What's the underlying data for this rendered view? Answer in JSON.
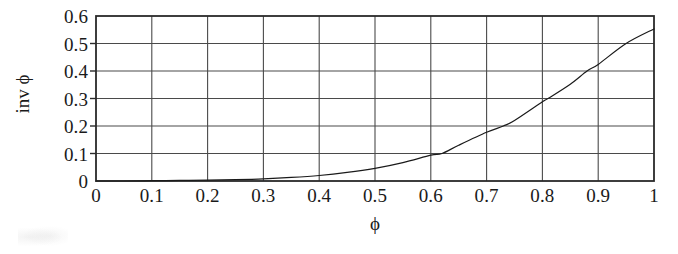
{
  "figure": {
    "background": "#ffffff",
    "ink_color": "#1a1a1a",
    "grid_color": "#4a4a4a",
    "frame_color": "#2a2a2a",
    "curve_color": "#1a1a1a"
  },
  "chart_data": {
    "type": "line",
    "title": "",
    "subtitle": "",
    "xlabel": "ϕ",
    "ylabel": "inv ϕ",
    "xlim": [
      0,
      1
    ],
    "ylim": [
      0,
      0.6
    ],
    "grid": true,
    "legend": null,
    "legend_position": "none",
    "xticks": [
      0,
      0.1,
      0.2,
      0.3,
      0.4,
      0.5,
      0.6,
      0.7,
      0.8,
      0.9,
      1
    ],
    "xticklabels": [
      "0",
      "0.1",
      "0.2",
      "0.3",
      "0.4",
      "0.5",
      "0.6",
      "0.7",
      "0.8",
      "0.9",
      "1"
    ],
    "yticks": [
      0,
      0.1,
      0.2,
      0.3,
      0.4,
      0.5,
      0.6
    ],
    "yticklabels": [
      "0",
      "0.1",
      "0.2",
      "0.3",
      "0.4",
      "0.5",
      "0.6"
    ],
    "series": [
      {
        "name": "inv ϕ",
        "linewidth": 1.2,
        "color": "#1a1a1a",
        "x": [
          0.0,
          0.05,
          0.1,
          0.15,
          0.2,
          0.25,
          0.3,
          0.35,
          0.4,
          0.45,
          0.5,
          0.55,
          0.6,
          0.62,
          0.65,
          0.7,
          0.73,
          0.75,
          0.8,
          0.81,
          0.85,
          0.88,
          0.9,
          0.95,
          1.0
        ],
        "y": [
          0.0,
          0.0,
          0.001,
          0.002,
          0.003,
          0.005,
          0.008,
          0.013,
          0.02,
          0.031,
          0.046,
          0.067,
          0.094,
          0.1,
          0.13,
          0.177,
          0.2,
          0.22,
          0.288,
          0.3,
          0.352,
          0.4,
          0.424,
          0.5,
          0.553
        ]
      }
    ],
    "annotations": []
  }
}
